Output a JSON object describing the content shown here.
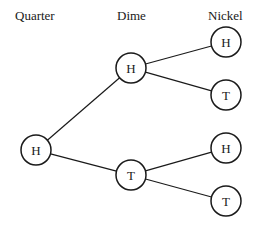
{
  "headers": {
    "quarter": "Quarter",
    "dime": "Dime",
    "nickel": "Nickel"
  },
  "nodes": {
    "root": {
      "label": "H",
      "x": 36,
      "y": 150
    },
    "dime_h": {
      "label": "H",
      "x": 131,
      "y": 68
    },
    "dime_t": {
      "label": "T",
      "x": 131,
      "y": 175
    },
    "nickel_hh": {
      "label": "H",
      "x": 226,
      "y": 42
    },
    "nickel_ht": {
      "label": "T",
      "x": 226,
      "y": 95
    },
    "nickel_th": {
      "label": "H",
      "x": 226,
      "y": 148
    },
    "nickel_tt": {
      "label": "T",
      "x": 226,
      "y": 201
    }
  },
  "edges": [
    [
      "root",
      "dime_h"
    ],
    [
      "root",
      "dime_t"
    ],
    [
      "dime_h",
      "nickel_hh"
    ],
    [
      "dime_h",
      "nickel_ht"
    ],
    [
      "dime_t",
      "nickel_th"
    ],
    [
      "dime_t",
      "nickel_tt"
    ]
  ],
  "style": {
    "stroke": "#1a1a1a",
    "radius": 15
  }
}
